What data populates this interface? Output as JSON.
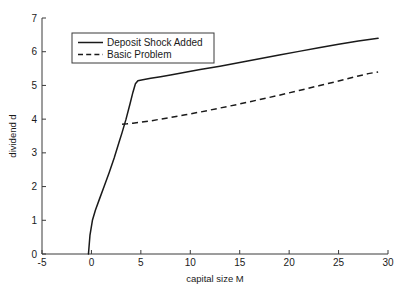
{
  "chart_data": {
    "type": "line",
    "title": "",
    "subtitle": "",
    "xlabel": "capital size M",
    "ylabel": "dividend d",
    "xlim": [
      -5,
      30
    ],
    "ylim": [
      0,
      7
    ],
    "xticks": [
      -5,
      0,
      5,
      10,
      15,
      20,
      25,
      30
    ],
    "xtick_labels": [
      "-5",
      "0",
      "5",
      "10",
      "15",
      "20",
      "25",
      "30"
    ],
    "yticks": [
      0,
      1,
      2,
      3,
      4,
      5,
      6,
      7
    ],
    "ytick_labels": [
      "0",
      "1",
      "2",
      "3",
      "4",
      "5",
      "6",
      "7"
    ],
    "grid": false,
    "legend_position": "upper-left-inside",
    "series": [
      {
        "name": "Deposit Shock Added",
        "style": "solid",
        "color": "#1a1a1a",
        "x": [
          -0.3,
          -0.15,
          0.1,
          0.4,
          0.8,
          1.3,
          1.8,
          2.3,
          2.8,
          3.1,
          3.5,
          3.9,
          4.2,
          4.45,
          4.7,
          5.2,
          6.0,
          7.0,
          8.0,
          9.5,
          11.0,
          13.0,
          15.0,
          17.0,
          19.0,
          21.0,
          23.0,
          25.0,
          27.0,
          29.0
        ],
        "y": [
          0.0,
          0.55,
          1.0,
          1.3,
          1.62,
          2.02,
          2.42,
          2.85,
          3.32,
          3.6,
          4.0,
          4.45,
          4.8,
          5.05,
          5.14,
          5.17,
          5.21,
          5.26,
          5.31,
          5.39,
          5.47,
          5.57,
          5.68,
          5.79,
          5.9,
          6.01,
          6.12,
          6.22,
          6.32,
          6.4
        ]
      },
      {
        "name": "Basic Problem",
        "style": "dashed",
        "color": "#1a1a1a",
        "x": [
          3.1,
          3.6,
          4.2,
          5.0,
          6.0,
          7.0,
          8.0,
          9.5,
          11.0,
          13.0,
          15.0,
          17.0,
          19.0,
          21.0,
          23.0,
          25.0,
          27.0,
          28.0,
          29.0
        ],
        "y": [
          3.85,
          3.86,
          3.88,
          3.91,
          3.95,
          4.0,
          4.05,
          4.13,
          4.21,
          4.33,
          4.45,
          4.58,
          4.71,
          4.85,
          4.99,
          5.13,
          5.28,
          5.35,
          5.4
        ]
      }
    ],
    "legend_entries": [
      "Deposit Shock Added",
      "Basic Problem"
    ],
    "annotations": []
  },
  "figure": {
    "background_color": "#ffffff",
    "axis_color": "#3a3a3a",
    "line_color": "#1a1a1a"
  }
}
